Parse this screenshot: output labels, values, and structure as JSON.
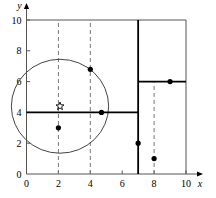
{
  "figure": {
    "title": "",
    "background_color": "#ffffff",
    "line_color": "#000000",
    "thin_line_color": "#555555"
  },
  "chart_data": {
    "type": "scatter",
    "title": "",
    "xlabel": "x",
    "ylabel": "y",
    "xlim": [
      0,
      10
    ],
    "ylim": [
      0,
      10
    ],
    "grid": false,
    "legend": "none",
    "xticks": [
      0,
      2,
      4,
      6,
      8,
      10
    ],
    "xticklabels": [
      "0",
      "2",
      "4",
      "6",
      "8",
      "10"
    ],
    "yticks": [
      0,
      2,
      4,
      6,
      8,
      10
    ],
    "yticklabels": [
      "0",
      "2",
      "4",
      "6",
      "8",
      "10"
    ],
    "points": [
      {
        "name": "point-a",
        "x": 4.0,
        "y": 6.8,
        "marker": "dot"
      },
      {
        "name": "point-b",
        "x": 4.7,
        "y": 4.0,
        "marker": "dot"
      },
      {
        "name": "point-c",
        "x": 2.0,
        "y": 3.0,
        "marker": "dot"
      },
      {
        "name": "point-d",
        "x": 7.0,
        "y": 2.0,
        "marker": "dot"
      },
      {
        "name": "point-e",
        "x": 8.0,
        "y": 1.0,
        "marker": "dot"
      },
      {
        "name": "point-f",
        "x": 9.0,
        "y": 6.0,
        "marker": "dot"
      }
    ],
    "star": {
      "name": "star-center",
      "x": 2.1,
      "y": 4.4,
      "marker": "star"
    },
    "circle": {
      "cx": 2.1,
      "cy": 4.4,
      "r": 3.05
    },
    "solid_segments": [
      {
        "name": "segment-y4",
        "x1": 0.0,
        "y1": 4.0,
        "x2": 7.0,
        "y2": 4.0
      },
      {
        "name": "segment-y6",
        "x1": 7.0,
        "y1": 6.0,
        "x2": 10.0,
        "y2": 6.0
      },
      {
        "name": "segment-x7",
        "x1": 7.0,
        "y1": 0.0,
        "x2": 7.0,
        "y2": 10.0
      }
    ],
    "frame_segments": [
      {
        "name": "frame-top",
        "x1": 0.0,
        "y1": 10.0,
        "x2": 10.0,
        "y2": 10.0
      },
      {
        "name": "frame-right",
        "x1": 10.0,
        "y1": 0.0,
        "x2": 10.0,
        "y2": 10.0
      }
    ],
    "dashed_segments": [
      {
        "name": "dashed-x2",
        "x1": 2.0,
        "y1": 0.0,
        "x2": 2.0,
        "y2": 10.0
      },
      {
        "name": "dashed-x4",
        "x1": 4.0,
        "y1": 0.0,
        "x2": 4.0,
        "y2": 10.0
      },
      {
        "name": "dashed-x8",
        "x1": 8.0,
        "y1": 0.0,
        "x2": 8.0,
        "y2": 6.0
      }
    ]
  }
}
